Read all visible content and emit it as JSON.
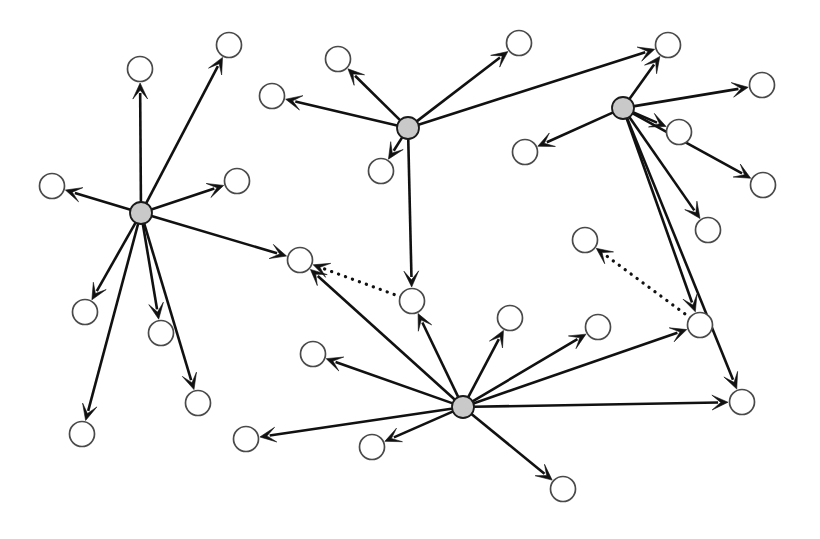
{
  "figure": {
    "width": 820,
    "height": 539,
    "background_color": "#ffffff"
  },
  "legend": {
    "hub_node_label": "hub node",
    "leaf_node_label": "leaf node",
    "solid_edge_label": "solid directed edge",
    "dotted_edge_label": "dotted directed edge"
  },
  "style": {
    "hub_fill": "#c9c9c9",
    "hub_stroke": "#1a1a1a",
    "leaf_fill": "#ffffff",
    "leaf_stroke": "#4a4a4a",
    "edge_color": "#111111",
    "edge_width": 2.6,
    "dotted_edge_width": 3.2,
    "hub_radius": 11,
    "leaf_radius": 12.5
  },
  "chart_data": {
    "type": "diagram",
    "graph_type": "directed",
    "node_count": 34,
    "hub_count": 4,
    "leaf_count": 30,
    "edge_count": 33,
    "solid_edge_count": 31,
    "dotted_edge_count": 2,
    "nodes": [
      {
        "id": "H1",
        "kind": "hub",
        "x": 141,
        "y": 213,
        "r": 11
      },
      {
        "id": "H2",
        "kind": "hub",
        "x": 408,
        "y": 128,
        "r": 11
      },
      {
        "id": "H3",
        "kind": "hub",
        "x": 623,
        "y": 108,
        "r": 11
      },
      {
        "id": "H4",
        "kind": "hub",
        "x": 463,
        "y": 407,
        "r": 11
      },
      {
        "id": "L1",
        "kind": "leaf",
        "x": 140,
        "y": 69,
        "r": 12.5
      },
      {
        "id": "L2",
        "kind": "leaf",
        "x": 229,
        "y": 45,
        "r": 12.5
      },
      {
        "id": "L3",
        "kind": "leaf",
        "x": 52,
        "y": 186,
        "r": 12.5
      },
      {
        "id": "L4",
        "kind": "leaf",
        "x": 237,
        "y": 181,
        "r": 12.5
      },
      {
        "id": "L5",
        "kind": "leaf",
        "x": 85,
        "y": 312,
        "r": 12.5
      },
      {
        "id": "L6",
        "kind": "leaf",
        "x": 161,
        "y": 333,
        "r": 12.5
      },
      {
        "id": "L7",
        "kind": "leaf",
        "x": 198,
        "y": 403,
        "r": 12.5
      },
      {
        "id": "L8",
        "kind": "leaf",
        "x": 82,
        "y": 434,
        "r": 12.5
      },
      {
        "id": "L9",
        "kind": "leaf",
        "x": 338,
        "y": 59,
        "r": 12.5
      },
      {
        "id": "L10",
        "kind": "leaf",
        "x": 272,
        "y": 96,
        "r": 12.5
      },
      {
        "id": "L11",
        "kind": "leaf",
        "x": 381,
        "y": 171,
        "r": 12.5
      },
      {
        "id": "L12",
        "kind": "leaf",
        "x": 519,
        "y": 43,
        "r": 12.5
      },
      {
        "id": "L13",
        "kind": "leaf",
        "x": 412,
        "y": 301,
        "r": 12.5
      },
      {
        "id": "L14",
        "kind": "leaf",
        "x": 668,
        "y": 45,
        "r": 12.5
      },
      {
        "id": "L15",
        "kind": "leaf",
        "x": 762,
        "y": 85,
        "r": 12.5
      },
      {
        "id": "L16",
        "kind": "leaf",
        "x": 679,
        "y": 132,
        "r": 12.5
      },
      {
        "id": "L17",
        "kind": "leaf",
        "x": 763,
        "y": 185,
        "r": 12.5
      },
      {
        "id": "L18",
        "kind": "leaf",
        "x": 708,
        "y": 230,
        "r": 12.5
      },
      {
        "id": "L19",
        "kind": "leaf",
        "x": 525,
        "y": 152,
        "r": 12.5
      },
      {
        "id": "L20",
        "kind": "leaf",
        "x": 585,
        "y": 240,
        "r": 12.5
      },
      {
        "id": "L21",
        "kind": "leaf",
        "x": 700,
        "y": 325,
        "r": 12.5
      },
      {
        "id": "L22",
        "kind": "leaf",
        "x": 742,
        "y": 402,
        "r": 12.5
      },
      {
        "id": "L23",
        "kind": "leaf",
        "x": 300,
        "y": 260,
        "r": 12.5
      },
      {
        "id": "L24",
        "kind": "leaf",
        "x": 313,
        "y": 354,
        "r": 12.5
      },
      {
        "id": "L25",
        "kind": "leaf",
        "x": 246,
        "y": 439,
        "r": 12.5
      },
      {
        "id": "L26",
        "kind": "leaf",
        "x": 372,
        "y": 447,
        "r": 12.5
      },
      {
        "id": "L27",
        "kind": "leaf",
        "x": 510,
        "y": 318,
        "r": 12.5
      },
      {
        "id": "L28",
        "kind": "leaf",
        "x": 598,
        "y": 327,
        "r": 12.5
      },
      {
        "id": "L29",
        "kind": "leaf",
        "x": 563,
        "y": 489,
        "r": 12.5
      },
      {
        "id": "L30",
        "kind": "leaf",
        "x": 622,
        "y": 47,
        "r": 0
      }
    ],
    "edges": [
      {
        "from": "H1",
        "to": "L1",
        "style": "solid"
      },
      {
        "from": "H1",
        "to": "L2",
        "style": "solid"
      },
      {
        "from": "H1",
        "to": "L3",
        "style": "solid"
      },
      {
        "from": "H1",
        "to": "L4",
        "style": "solid"
      },
      {
        "from": "H1",
        "to": "L5",
        "style": "solid"
      },
      {
        "from": "H1",
        "to": "L6",
        "style": "solid"
      },
      {
        "from": "H1",
        "to": "L7",
        "style": "solid"
      },
      {
        "from": "H1",
        "to": "L8",
        "style": "solid"
      },
      {
        "from": "H1",
        "to": "L23",
        "style": "solid"
      },
      {
        "from": "H2",
        "to": "L9",
        "style": "solid"
      },
      {
        "from": "H2",
        "to": "L10",
        "style": "solid"
      },
      {
        "from": "H2",
        "to": "L11",
        "style": "solid"
      },
      {
        "from": "H2",
        "to": "L12",
        "style": "solid"
      },
      {
        "from": "H2",
        "to": "L13",
        "style": "solid"
      },
      {
        "from": "H2",
        "to": "L14",
        "style": "solid"
      },
      {
        "from": "H3",
        "to": "L14",
        "style": "solid"
      },
      {
        "from": "H3",
        "to": "L15",
        "style": "solid"
      },
      {
        "from": "H3",
        "to": "L16",
        "style": "solid"
      },
      {
        "from": "H3",
        "to": "L17",
        "style": "solid"
      },
      {
        "from": "H3",
        "to": "L18",
        "style": "solid"
      },
      {
        "from": "H3",
        "to": "L19",
        "style": "solid"
      },
      {
        "from": "H3",
        "to": "L21",
        "style": "solid"
      },
      {
        "from": "H3",
        "to": "L22",
        "style": "solid"
      },
      {
        "from": "H4",
        "to": "L23",
        "style": "solid"
      },
      {
        "from": "H4",
        "to": "L13",
        "style": "solid"
      },
      {
        "from": "H4",
        "to": "L24",
        "style": "solid"
      },
      {
        "from": "H4",
        "to": "L25",
        "style": "solid"
      },
      {
        "from": "H4",
        "to": "L26",
        "style": "solid"
      },
      {
        "from": "H4",
        "to": "L27",
        "style": "solid"
      },
      {
        "from": "H4",
        "to": "L28",
        "style": "solid"
      },
      {
        "from": "H4",
        "to": "L29",
        "style": "solid"
      },
      {
        "from": "H4",
        "to": "L21",
        "style": "solid"
      },
      {
        "from": "H4",
        "to": "L22",
        "style": "solid"
      },
      {
        "from": "L13",
        "to": "L23",
        "style": "dotted"
      },
      {
        "from": "L21",
        "to": "L20",
        "style": "dotted"
      }
    ]
  }
}
